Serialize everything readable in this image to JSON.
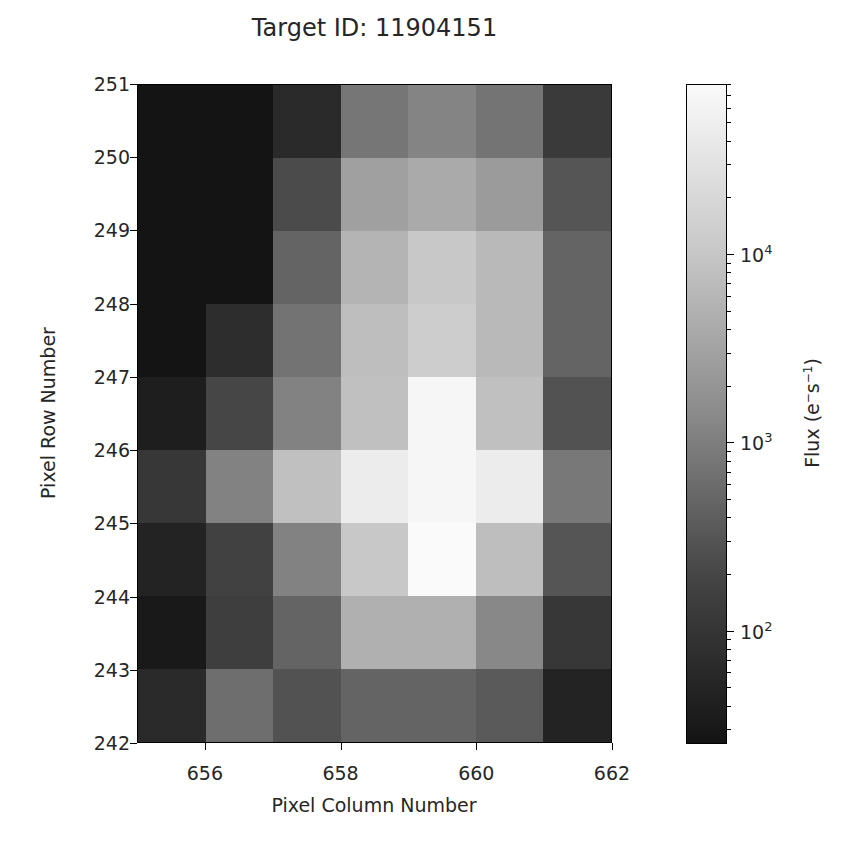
{
  "chart_data": {
    "type": "heatmap",
    "title": "Target ID: 11904151",
    "xlabel": "Pixel Column Number",
    "ylabel": "Pixel Row Number",
    "colorbar_label": "Flux (e⁻s⁻¹)",
    "colorbar_scale": "log",
    "colorbar_range": [
      25,
      80000
    ],
    "colorbar_ticks": [
      "10^2",
      "10^3",
      "10^4"
    ],
    "colormap": "gray",
    "xlim": [
      655,
      662
    ],
    "ylim": [
      242,
      251
    ],
    "x_ticks": [
      "656",
      "658",
      "660",
      "662"
    ],
    "y_ticks": [
      "242",
      "243",
      "244",
      "245",
      "246",
      "247",
      "248",
      "249",
      "250",
      "251"
    ],
    "columns": [
      655,
      656,
      657,
      658,
      659,
      660,
      661
    ],
    "rows_top_to_bottom": [
      250,
      249,
      248,
      247,
      246,
      245,
      244,
      243,
      242
    ],
    "gray_levels": [
      [
        20,
        20,
        42,
        118,
        132,
        116,
        58
      ],
      [
        20,
        20,
        75,
        160,
        170,
        155,
        85
      ],
      [
        20,
        20,
        100,
        180,
        200,
        185,
        100
      ],
      [
        20,
        45,
        115,
        190,
        205,
        185,
        100
      ],
      [
        30,
        70,
        130,
        192,
        246,
        192,
        82
      ],
      [
        55,
        130,
        192,
        236,
        246,
        236,
        120
      ],
      [
        35,
        65,
        130,
        200,
        250,
        190,
        85
      ],
      [
        25,
        62,
        100,
        176,
        176,
        136,
        55
      ],
      [
        42,
        110,
        82,
        100,
        100,
        90,
        35
      ]
    ],
    "flux_estimate": [
      [
        30,
        30,
        70,
        1300,
        2000,
        1300,
        150
      ],
      [
        30,
        30,
        250,
        5000,
        7000,
        4500,
        350
      ],
      [
        30,
        30,
        600,
        9000,
        17000,
        10000,
        600
      ],
      [
        30,
        120,
        1000,
        12000,
        20000,
        10000,
        600
      ],
      [
        45,
        300,
        1600,
        13000,
        60000,
        13000,
        350
      ],
      [
        110,
        1500,
        13000,
        50000,
        60000,
        50000,
        1200
      ],
      [
        55,
        250,
        1600,
        15000,
        70000,
        12000,
        380
      ],
      [
        38,
        220,
        600,
        8000,
        8000,
        1800,
        110
      ],
      [
        65,
        900,
        380,
        600,
        600,
        450,
        55
      ]
    ]
  },
  "labels": {
    "title": "Target ID: 11904151",
    "xlabel": "Pixel Column Number",
    "ylabel": "Pixel Row Number",
    "cbar_title_base": "Flux (e",
    "cbar_sup1": "−",
    "cbar_mid": "s",
    "cbar_sup2": "−1",
    "cbar_close": ")",
    "cbar_ticks": [
      {
        "base": "10",
        "exp": "4"
      },
      {
        "base": "10",
        "exp": "3"
      },
      {
        "base": "10",
        "exp": "2"
      }
    ]
  }
}
